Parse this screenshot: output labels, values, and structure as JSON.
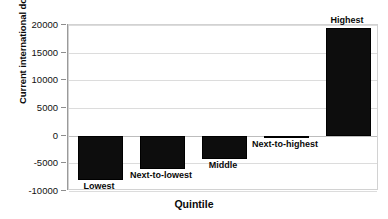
{
  "chart_data": {
    "type": "bar",
    "title": "",
    "xlabel": "Quintile",
    "ylabel": "Current international dollars",
    "categories": [
      "Lowest",
      "Next-to-lowest",
      "Middle",
      "Next-to-highest",
      "Highest"
    ],
    "values": [
      -8000,
      -6000,
      -4300,
      -200,
      19400
    ],
    "ylim": [
      -10000,
      20000
    ],
    "yticks": [
      20000,
      15000,
      10000,
      5000,
      0,
      -5000,
      -10000
    ],
    "ytick_labels": [
      "20000",
      "15000",
      "10000",
      "5000",
      "0",
      "-5000",
      "-10000"
    ],
    "grid": true,
    "legend": "none",
    "bar_color": "#0d0d0d",
    "grid_color": "#dcdcdc",
    "axis_color": "#9a9a9a"
  }
}
